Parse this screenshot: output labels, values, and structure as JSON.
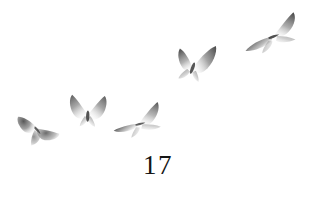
{
  "page": {
    "background_color": "#ffffff",
    "width": 316,
    "height": 200,
    "ink_color": "#151515"
  },
  "folio": {
    "number": "17",
    "x": 0,
    "y": 152,
    "font_size": 27,
    "color": "#151515"
  },
  "plate": {
    "caption": "five butterflies in flight",
    "specimen_count": 5,
    "ink_color": "#4a4a4a",
    "butterflies": [
      {
        "id": "butterfly-1",
        "name": "butterfly-lower-left",
        "x": 16,
        "y": 106,
        "w": 46,
        "h": 44,
        "rotate": -14,
        "pose": "wings-open-downward",
        "opacity": 0.9,
        "tone": "#5a5a5a"
      },
      {
        "id": "butterfly-2",
        "name": "butterfly-left-center",
        "x": 64,
        "y": 89,
        "w": 48,
        "h": 40,
        "rotate": 2,
        "pose": "wings-raised-v",
        "opacity": 0.92,
        "tone": "#525252"
      },
      {
        "id": "butterfly-3",
        "name": "butterfly-center-low",
        "x": 110,
        "y": 104,
        "w": 56,
        "h": 36,
        "rotate": -18,
        "pose": "wings-tilted-glide",
        "opacity": 0.88,
        "tone": "#565656"
      },
      {
        "id": "butterfly-4",
        "name": "butterfly-upper-center",
        "x": 170,
        "y": 38,
        "w": 48,
        "h": 46,
        "rotate": 12,
        "pose": "wings-raised-tilted",
        "opacity": 0.9,
        "tone": "#505050"
      },
      {
        "id": "butterfly-5",
        "name": "butterfly-upper-right",
        "x": 240,
        "y": 14,
        "w": 62,
        "h": 40,
        "rotate": -20,
        "pose": "wings-spread-horizontal",
        "opacity": 0.9,
        "tone": "#4e4e4e"
      }
    ]
  }
}
